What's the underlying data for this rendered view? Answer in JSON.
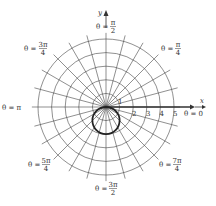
{
  "figure": {
    "type": "polar-graph",
    "curve": "r = -2 sin(theta)",
    "center_px": [
      106,
      107
    ],
    "unit_px": 13.6,
    "rings": [
      1,
      2,
      3,
      4,
      5
    ],
    "spoke_step_deg": 15,
    "ring_tick_labels": [
      "1",
      "2",
      "3",
      "4",
      "5"
    ],
    "axis_labels": {
      "x": "x",
      "y": "y"
    },
    "angle_labels": {
      "theta_0": {
        "text": "θ = 0"
      },
      "theta_pi_4": {
        "num": "π",
        "den": "4",
        "prefix": "θ = "
      },
      "theta_pi_2": {
        "num": "π",
        "den": "2",
        "prefix": "θ = "
      },
      "theta_3pi_4": {
        "num": "3π",
        "den": "4",
        "prefix": "θ = "
      },
      "theta_pi": {
        "text": "θ = π"
      },
      "theta_5pi_4": {
        "num": "5π",
        "den": "4",
        "prefix": "θ = "
      },
      "theta_3pi_2": {
        "num": "3π",
        "den": "2",
        "prefix": "θ = "
      },
      "theta_7pi_4": {
        "num": "7π",
        "den": "4",
        "prefix": "θ = "
      }
    },
    "colors": {
      "grid": "#444444",
      "curve": "#222222",
      "text": "#333333"
    }
  }
}
